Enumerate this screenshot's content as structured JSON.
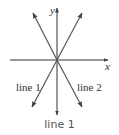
{
  "diagram": {
    "x_axis_label": "x",
    "y_axis_label": "y",
    "lines": [
      {
        "label": "line 1",
        "direction": "bottom-left to top-right",
        "slope_sign": "positive"
      },
      {
        "label": "line 2",
        "direction": "top-left to bottom-right",
        "slope_sign": "negative"
      }
    ],
    "colors": {
      "axes": "#333333",
      "lines": "#555555"
    }
  },
  "caption": "line 1"
}
